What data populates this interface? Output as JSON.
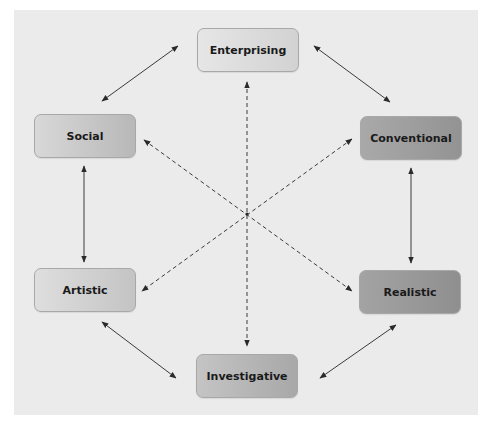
{
  "diagram": {
    "nodes": [
      {
        "id": "enterprising",
        "label": "Enterprising",
        "x": 197,
        "y": 28,
        "gradient_from": "#e6e6e6",
        "gradient_to": "#d2d2d2"
      },
      {
        "id": "social",
        "label": "Social",
        "x": 34,
        "y": 114,
        "gradient_from": "#d8d8d8",
        "gradient_to": "#b8b8b8"
      },
      {
        "id": "conventional",
        "label": "Conventional",
        "x": 360,
        "y": 116,
        "gradient_from": "#a9a9a9",
        "gradient_to": "#939393"
      },
      {
        "id": "artistic",
        "label": "Artistic",
        "x": 34,
        "y": 268,
        "gradient_from": "#dedede",
        "gradient_to": "#c4c4c4"
      },
      {
        "id": "realistic",
        "label": "Realistic",
        "x": 359,
        "y": 270,
        "gradient_from": "#a3a3a3",
        "gradient_to": "#8f8f8f"
      },
      {
        "id": "investigative",
        "label": "Investigative",
        "x": 196,
        "y": 354,
        "gradient_from": "#c4c4c4",
        "gradient_to": "#a8a8a8"
      }
    ],
    "adjacent_links": [
      {
        "from": "social",
        "to": "enterprising",
        "style": "solid",
        "bidirectional": true
      },
      {
        "from": "enterprising",
        "to": "conventional",
        "style": "solid",
        "bidirectional": true
      },
      {
        "from": "social",
        "to": "artistic",
        "style": "solid",
        "bidirectional": true
      },
      {
        "from": "conventional",
        "to": "realistic",
        "style": "solid",
        "bidirectional": true
      },
      {
        "from": "artistic",
        "to": "investigative",
        "style": "solid",
        "bidirectional": true
      },
      {
        "from": "investigative",
        "to": "realistic",
        "style": "solid",
        "bidirectional": true
      }
    ],
    "opposite_links": [
      {
        "from": "enterprising",
        "to": "investigative",
        "style": "dashed",
        "bidirectional": true
      },
      {
        "from": "social",
        "to": "realistic",
        "style": "dashed",
        "bidirectional": true
      },
      {
        "from": "conventional",
        "to": "artistic",
        "style": "dashed",
        "bidirectional": true
      }
    ],
    "colors": {
      "panel_background": "#ebebeb",
      "line": "#3a3a3a",
      "text": "#1a1a1a"
    }
  }
}
